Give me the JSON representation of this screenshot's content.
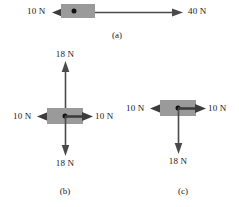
{
  "figure": {
    "background_color": "#ffffff",
    "block_color": "#9a9a9a",
    "arrow_color": "#3c3c3c",
    "text_color": "#1a1a1a"
  },
  "panels": [
    {
      "caption": "(a)",
      "forces": [
        {
          "label": "10 N",
          "magnitude": 10,
          "unit": "N",
          "direction": "left"
        },
        {
          "label": "40 N",
          "magnitude": 40,
          "unit": "N",
          "direction": "right"
        }
      ]
    },
    {
      "caption": "(b)",
      "forces": [
        {
          "label": "18 N",
          "magnitude": 18,
          "unit": "N",
          "direction": "up"
        },
        {
          "label": "10 N",
          "magnitude": 10,
          "unit": "N",
          "direction": "left"
        },
        {
          "label": "10 N",
          "magnitude": 10,
          "unit": "N",
          "direction": "right"
        },
        {
          "label": "18 N",
          "magnitude": 18,
          "unit": "N",
          "direction": "down"
        }
      ]
    },
    {
      "caption": "(c)",
      "forces": [
        {
          "label": "10 N",
          "magnitude": 10,
          "unit": "N",
          "direction": "left"
        },
        {
          "label": "10 N",
          "magnitude": 10,
          "unit": "N",
          "direction": "right"
        },
        {
          "label": "18 N",
          "magnitude": 18,
          "unit": "N",
          "direction": "down"
        }
      ]
    }
  ]
}
